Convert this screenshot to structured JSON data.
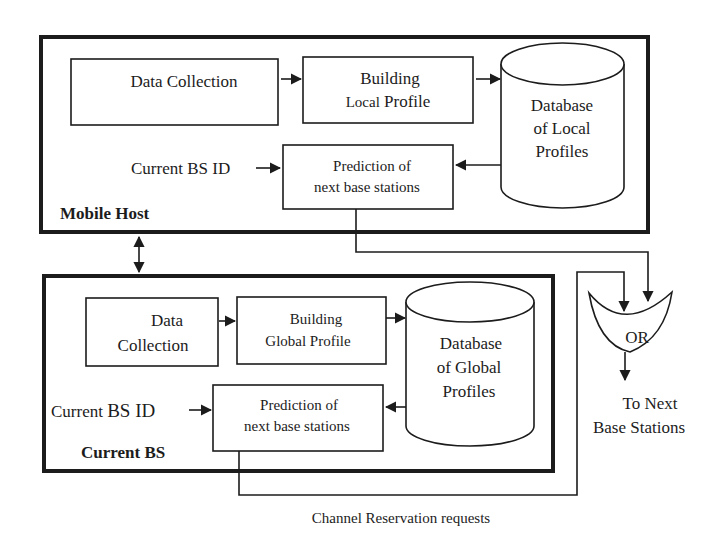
{
  "mobile_host": {
    "title": "Mobile Host",
    "data_collection": "Data Collection",
    "building_profile": {
      "line1": "Building",
      "line2_small": "Local",
      "line2_rest": " Profile"
    },
    "database": {
      "line1": "Database",
      "line2": "of Local",
      "line3": "Profiles"
    },
    "input_label": "Current BS ID",
    "prediction": {
      "line1": "Prediction of",
      "line2": "next base stations"
    }
  },
  "current_bs": {
    "title": "Current BS",
    "data_collection": {
      "line1": "Data",
      "line2": "Collection"
    },
    "building_profile": {
      "line1": "Building",
      "line2": "Global Profile"
    },
    "database": {
      "line1": "Database",
      "line2": "of Global",
      "line3": "Profiles"
    },
    "input_label_prefix": "Current ",
    "input_label_big": "BS ID",
    "prediction": {
      "line1": "Prediction of",
      "line2": "next base stations"
    }
  },
  "or_gate": {
    "label": "OR"
  },
  "output": {
    "line1": "To Next",
    "line2": "Base Stations"
  },
  "caption": "Channel Reservation requests",
  "colors": {
    "ink": "#1c1c1c",
    "background": "#ffffff"
  }
}
